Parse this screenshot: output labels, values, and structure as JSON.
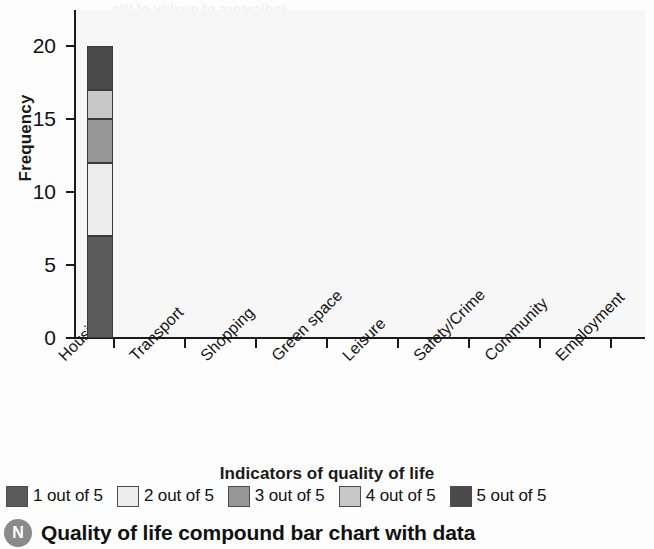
{
  "chart_data": {
    "type": "bar",
    "subtype": "stacked-bar",
    "title": "",
    "xlabel": "Indicators of quality of life",
    "ylabel": "Frequency",
    "categories": [
      "Housing",
      "Transport",
      "Shopping",
      "Green space",
      "Leisure",
      "Safety/Crime",
      "Community",
      "Employment"
    ],
    "yticks": [
      0,
      5,
      10,
      15,
      20
    ],
    "ylim": [
      0,
      22
    ],
    "grid": false,
    "legend_position": "bottom",
    "series": [
      {
        "name": "1 out of 5",
        "color": "#5a5a5a",
        "values": [
          7,
          0,
          0,
          0,
          0,
          0,
          0,
          0
        ]
      },
      {
        "name": "2 out of 5",
        "color": "#ededed",
        "values": [
          5,
          0,
          0,
          0,
          0,
          0,
          0,
          0
        ]
      },
      {
        "name": "3 out of 5",
        "color": "#969696",
        "values": [
          3,
          0,
          0,
          0,
          0,
          0,
          0,
          0
        ]
      },
      {
        "name": "4 out of 5",
        "color": "#c8c8c8",
        "values": [
          2,
          0,
          0,
          0,
          0,
          0,
          0,
          0
        ]
      },
      {
        "name": "5 out of 5",
        "color": "#4a4a4a",
        "values": [
          3,
          0,
          0,
          0,
          0,
          0,
          0,
          0
        ]
      }
    ],
    "cumulative_boundaries_housing": [
      0,
      7,
      12,
      15,
      17,
      20
    ],
    "annotations": []
  },
  "axes": {
    "ylabel": "Frequency",
    "xlabel": "Indicators of quality of life",
    "ytick_labels": [
      "20",
      "15",
      "10",
      "5",
      "0"
    ],
    "xtick_labels": [
      "Housing",
      "Transport",
      "Shopping",
      "Green space",
      "Leisure",
      "Safety/Crime",
      "Community",
      "Employment"
    ]
  },
  "legend": {
    "items": [
      {
        "label": "1 out of 5",
        "color": "#5a5a5a"
      },
      {
        "label": "2 out of 5",
        "color": "#ededed"
      },
      {
        "label": "3 out of 5",
        "color": "#969696"
      },
      {
        "label": "4 out of 5",
        "color": "#c8c8c8"
      },
      {
        "label": "5 out of 5",
        "color": "#4a4a4a"
      }
    ]
  },
  "caption": {
    "badge": "N",
    "text": "Quality of life compound bar chart with data"
  },
  "bleed_through": {
    "line1": "Indicators of quality of life",
    "line2": "quality of life compound bar chart",
    "word1": "Housing",
    "word2": "Transport",
    "word3": "Shopping"
  }
}
